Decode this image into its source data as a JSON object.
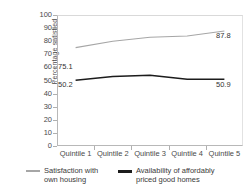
{
  "chart_data": {
    "type": "line",
    "title": "",
    "xlabel": "",
    "ylabel": "Percentage satisfied",
    "ylim": [
      0,
      100
    ],
    "ytick_step": 10,
    "yticks": [
      100,
      90,
      80,
      70,
      60,
      50,
      40,
      30,
      20,
      10,
      0
    ],
    "grid": false,
    "legend_position": "bottom",
    "categories": [
      "Quintile 1",
      "Quintile 2",
      "Quintile 3",
      "Quintile 4",
      "Quintile 5"
    ],
    "series": [
      {
        "name": "Satisfaction with own housing",
        "legend_line1": "Satisfaction with",
        "legend_line2": "own housing",
        "color": "#a6a6a6",
        "values": [
          75.1,
          80.0,
          83.0,
          84.0,
          87.8
        ],
        "labels": [
          {
            "category": "Quintile 1",
            "value": "75.1"
          },
          {
            "category": "Quintile 5",
            "value": "87.8"
          }
        ]
      },
      {
        "name": "Availability of affordably priced good homes",
        "legend_line1": "Availability of affordably",
        "legend_line2": "priced good homes",
        "color": "#1c1c1c",
        "values": [
          50.2,
          53.0,
          54.0,
          51.0,
          50.9
        ],
        "labels": [
          {
            "category": "Quintile 1",
            "value": "50.2"
          },
          {
            "category": "Quintile 5",
            "value": "50.9"
          }
        ]
      }
    ]
  },
  "axis": {
    "y_title": "Percentage satisfied",
    "y_ticks": [
      "100",
      "90",
      "80",
      "70",
      "60",
      "50",
      "40",
      "30",
      "20",
      "10",
      "0"
    ],
    "x_ticks": [
      "Quintile 1",
      "Quintile 2",
      "Quintile 3",
      "Quintile 4",
      "Quintile 5"
    ]
  },
  "data_labels": {
    "series1_first": "75.1",
    "series1_last": "87.8",
    "series2_first": "50.2",
    "series2_last": "50.9"
  },
  "legend": {
    "item1_line1": "Satisfaction with",
    "item1_line2": "own housing",
    "item2_line1": "Availability of affordably",
    "item2_line2": "priced good homes"
  }
}
